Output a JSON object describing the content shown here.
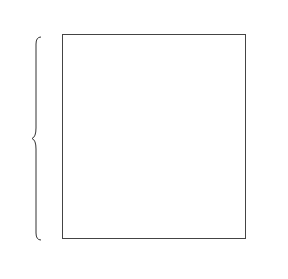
{
  "diagram": {
    "top_row": {
      "values": [
        "0",
        "0",
        "0",
        "0",
        "0",
        "0",
        "0",
        "0",
        "0"
      ],
      "arrow": "←",
      "label": "y",
      "label_sub": "0"
    },
    "bottom_row": {
      "values": [
        "1",
        "1",
        "1",
        "1",
        "1",
        "1",
        "1",
        "1",
        "1"
      ],
      "arrow": "←",
      "label": "x",
      "label_sub": "0"
    },
    "vector_label": "V",
    "vector": [
      "0",
      "1",
      "0",
      "0",
      "1",
      "1",
      "0",
      "0",
      "1",
      "0"
    ],
    "matrix": [
      [
        "0",
        "0",
        "0",
        "0",
        "0",
        "0",
        "0",
        "0",
        "0"
      ],
      [
        "0",
        "0",
        "0",
        "0",
        "0",
        "0",
        "0",
        "0",
        "0"
      ],
      [
        "1",
        "0",
        "0",
        "0",
        "0",
        "0",
        "0",
        "0",
        "0"
      ],
      [
        "0",
        "1",
        "0",
        "0",
        "0",
        "0",
        "0",
        "0",
        "0"
      ],
      [
        "1",
        "0",
        "1",
        "0",
        "0",
        "0",
        "0",
        "0",
        "0"
      ],
      [
        "0",
        "1",
        "0",
        "1",
        "0",
        "0",
        "0",
        "0",
        "0"
      ],
      [
        "1",
        "0",
        "1",
        "0",
        "1",
        "1",
        "1",
        "1",
        "1"
      ],
      [
        "0",
        "1",
        "0",
        "1",
        "1",
        "1",
        "1",
        "1",
        "1"
      ],
      [
        "0",
        "0",
        "1",
        "1",
        "1",
        "1",
        "1",
        "1",
        "1"
      ],
      [
        "1",
        "1",
        "1",
        "1",
        "1",
        "1",
        "1",
        "1",
        "1"
      ]
    ]
  }
}
